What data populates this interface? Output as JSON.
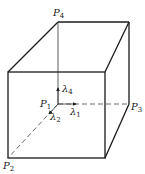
{
  "diagram": {
    "title": "",
    "points": {
      "P1": {
        "name": "P",
        "sub": "1"
      },
      "P2": {
        "name": "P",
        "sub": "2"
      },
      "P3": {
        "name": "P",
        "sub": "3"
      },
      "P4": {
        "name": "P",
        "sub": "4"
      }
    },
    "vectors": {
      "lambda1": {
        "name": "λ",
        "sub": "1"
      },
      "lambda2": {
        "name": "λ",
        "sub": "2"
      },
      "lambda4": {
        "name": "λ",
        "sub": "4"
      }
    },
    "colors": {
      "line": "#1a1a1a",
      "background": "#ffffff"
    }
  }
}
